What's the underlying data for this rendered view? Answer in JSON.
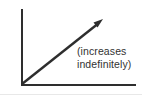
{
  "figure": {
    "annotation": {
      "line1": "(increases",
      "line2": "indefinitely)"
    }
  },
  "icons": {
    "trend-arrowhead-icon": "filled triangle pointing up-right"
  },
  "colors": {
    "line": "#2e2e2e",
    "text": "#323232",
    "background": "#ffffff",
    "page_edge": "#d9d9d9"
  }
}
